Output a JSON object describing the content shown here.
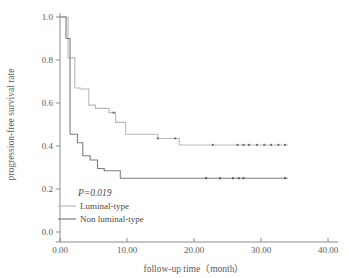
{
  "chart_data": {
    "type": "line",
    "subtype": "kaplan-meier-step",
    "title": "",
    "xlabel": "follow-up time（month）",
    "ylabel": "progression-free survival rate",
    "xlim": [
      0,
      40
    ],
    "ylim": [
      0,
      1.0
    ],
    "xticks": [
      0,
      10,
      20,
      30,
      40
    ],
    "xtick_labels": [
      "0.00",
      "10.00",
      "20.00",
      "30.00",
      "40.00"
    ],
    "yticks": [
      0.0,
      0.2,
      0.4,
      0.6,
      0.8,
      1.0
    ],
    "ytick_labels": [
      "0.0",
      "0.2",
      "0.4",
      "0.6",
      "0.8",
      "1.0"
    ],
    "grid": false,
    "legend_position": "lower-left-inside",
    "annotations": [
      {
        "name": "p-value",
        "text": "P=0.019",
        "x": 4.5,
        "y": 0.175
      }
    ],
    "series": [
      {
        "name": "Luminal-type",
        "color": "#b9b9b9",
        "line_width": 1.1,
        "steps_x": [
          0.0,
          1.2,
          1.2,
          2.2,
          2.2,
          3.0,
          3.0,
          4.3,
          4.3,
          5.3,
          5.3,
          7.3,
          7.3,
          8.3,
          8.3,
          9.8,
          9.8,
          14.6,
          14.6,
          17.8,
          17.8,
          34.0
        ],
        "steps_y": [
          1.0,
          1.0,
          0.81,
          0.81,
          0.67,
          0.67,
          0.665,
          0.665,
          0.59,
          0.59,
          0.575,
          0.575,
          0.555,
          0.555,
          0.51,
          0.51,
          0.455,
          0.455,
          0.435,
          0.435,
          0.405,
          0.405
        ],
        "censor_x": [
          8.0,
          14.6,
          17.2,
          22.8,
          26.5,
          27.4,
          28.2,
          29.4,
          30.5,
          31.5,
          32.6,
          33.6
        ],
        "censor_y": [
          0.555,
          0.435,
          0.435,
          0.405,
          0.405,
          0.405,
          0.405,
          0.405,
          0.405,
          0.405,
          0.405,
          0.405
        ],
        "final_survival": 0.405
      },
      {
        "name": "Non luminal-type",
        "color": "#7d7d7d",
        "line_width": 1.1,
        "steps_x": [
          0.0,
          0.9,
          0.9,
          1.5,
          1.5,
          2.6,
          2.6,
          3.4,
          3.4,
          4.5,
          4.5,
          5.6,
          5.6,
          6.6,
          6.6,
          9.0,
          9.0,
          34.0
        ],
        "steps_y": [
          1.0,
          1.0,
          0.9,
          0.9,
          0.455,
          0.455,
          0.415,
          0.415,
          0.355,
          0.355,
          0.335,
          0.335,
          0.295,
          0.295,
          0.285,
          0.285,
          0.25,
          0.25
        ],
        "censor_x": [
          21.8,
          23.9,
          25.8,
          26.7,
          27.4,
          33.6
        ],
        "censor_y": [
          0.25,
          0.25,
          0.25,
          0.25,
          0.25,
          0.25
        ],
        "final_survival": 0.25
      }
    ]
  },
  "legend": {
    "p_value": "P=0.019",
    "entries": [
      {
        "label": "Luminal-type",
        "color": "#b9b9b9"
      },
      {
        "label": "Non luminal-type",
        "color": "#7d7d7d"
      }
    ]
  },
  "axes": {
    "x_title": "follow-up time（month）",
    "y_title": "progression-free survival rate",
    "x_tick_labels": [
      "0.00",
      "10.00",
      "20.00",
      "30.00",
      "40.00"
    ],
    "y_tick_labels": [
      "0.0",
      "0.2",
      "0.4",
      "0.6",
      "0.8",
      "1.0"
    ]
  },
  "colors": {
    "axis": "#8c8c8c",
    "text": "#4a4a4a",
    "luminal": "#b9b9b9",
    "non_luminal": "#7d7d7d",
    "background": "#ffffff"
  }
}
